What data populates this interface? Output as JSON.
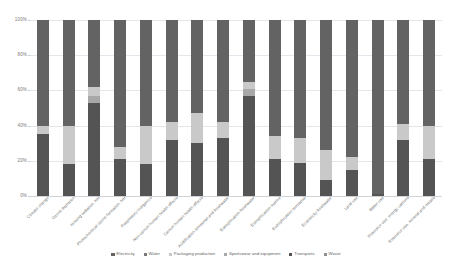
{
  "chart_data": {
    "type": "bar",
    "subtype": "stacked-100-percent",
    "title": "",
    "subtitle": "",
    "xlabel": "",
    "ylabel": "",
    "ylim": [
      0,
      100
    ],
    "yticks": [
      "0%",
      "20%",
      "40%",
      "60%",
      "80%",
      "100%"
    ],
    "ytick_values": [
      0,
      20,
      40,
      60,
      80,
      100
    ],
    "grid": true,
    "legend_position": "bottom",
    "stack_order_bottom_to_top": [
      "Transports",
      "Sportswear and equipment",
      "Packaging production",
      "Waste",
      "Water",
      "Electricity"
    ],
    "categories": [
      "Climate change",
      "Ozone depletion",
      "Ionising radiation, HH",
      "Photochemical ozone formation, HH",
      "Respiratory inorganics",
      "Non-cancer human health effects",
      "Cancer human health effects",
      "Acidification terrestrial and freshwater",
      "Eutrophication freshwater",
      "Eutrophication marine",
      "Eutrophication terrestrial",
      "Ecotoxicity freshwater",
      "Land use",
      "Water use",
      "Resource use, energy carriers",
      "Resource use, mineral and metals"
    ],
    "series": [
      {
        "name": "Electricity",
        "color": "#636363",
        "values": [
          60,
          60,
          38,
          72,
          60,
          58,
          53,
          58,
          35,
          66,
          67,
          74,
          78,
          99,
          59,
          60
        ]
      },
      {
        "name": "Water",
        "color": "#7b7b7b",
        "values": [
          0,
          0,
          0,
          0,
          0,
          0,
          0,
          0,
          0,
          0,
          0,
          0,
          0,
          0,
          0,
          0
        ]
      },
      {
        "name": "Packaging production",
        "color": "#c9c9c9",
        "values": [
          5,
          22,
          5,
          7,
          22,
          10,
          17,
          9,
          4,
          13,
          14,
          17,
          7,
          0,
          9,
          19
        ]
      },
      {
        "name": "Sportswear and equipment",
        "color": "#a8a8a8",
        "values": [
          0,
          0,
          4,
          0,
          0,
          0,
          0,
          0,
          4,
          0,
          0,
          0,
          0,
          0,
          0,
          0
        ]
      },
      {
        "name": "Transports",
        "color": "#545454",
        "values": [
          35,
          18,
          53,
          21,
          18,
          32,
          30,
          33,
          57,
          21,
          19,
          9,
          15,
          1,
          32,
          21
        ]
      },
      {
        "name": "Waste",
        "color": "#8f8f8f",
        "values": [
          0,
          0,
          0,
          0,
          0,
          0,
          0,
          0,
          0,
          0,
          0,
          0,
          0,
          0,
          0,
          0
        ]
      }
    ]
  },
  "legend": {
    "items": [
      {
        "label": "Electricity",
        "color": "#636363"
      },
      {
        "label": "Water",
        "color": "#7b7b7b"
      },
      {
        "label": "Packaging production",
        "color": "#c9c9c9"
      },
      {
        "label": "Sportswear and equipment",
        "color": "#a8a8a8"
      },
      {
        "label": "Transports",
        "color": "#545454"
      },
      {
        "label": "Waste",
        "color": "#8f8f8f"
      }
    ]
  },
  "colors": {
    "grid": "#e3e6ea",
    "axis": "#d0d4d9",
    "text": "#6e6e6e",
    "background": "#ffffff"
  }
}
